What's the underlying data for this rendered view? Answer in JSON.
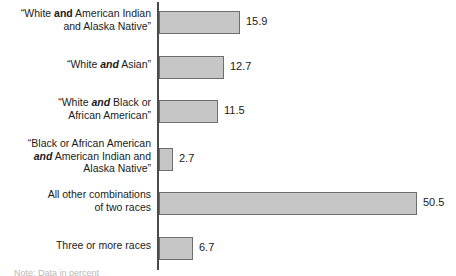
{
  "chart_data": {
    "type": "bar",
    "orientation": "horizontal",
    "title": "",
    "subtitle": "",
    "xlabel": "",
    "ylabel": "",
    "grid": false,
    "legend": null,
    "axis_range": [
      0,
      50.5
    ],
    "categories": [
      "“White and American Indian\nand Alaska Native”",
      "“White and Asian”",
      "“White and Black or\nAfrican American”",
      "“Black or African American\nand American Indian and\nAlaska Native”",
      "All other combinations\nof two races",
      "Three or more races"
    ],
    "values": [
      15.9,
      12.7,
      11.5,
      2.7,
      50.5,
      6.7
    ],
    "value_labels": [
      "15.9",
      "12.7",
      "11.5",
      "2.7",
      "50.5",
      "6.7"
    ]
  },
  "bars": [
    {
      "label_html": "“White <b>and</b> American Indian<br>and Alaska Native”",
      "value": 15.9,
      "value_label": "15.9",
      "top": 11,
      "label_top": 7,
      "lines": 2
    },
    {
      "label_html": "“White <i>and</i> Asian”",
      "value": 12.7,
      "value_label": "12.7",
      "top": 56,
      "label_top": 58,
      "lines": 1
    },
    {
      "label_html": "“White <i>and</i> Black or<br>African American”",
      "value": 11.5,
      "value_label": "11.5",
      "top": 100,
      "label_top": 96,
      "lines": 2
    },
    {
      "label_html": "“Black or African American<br><i>and</i> American Indian and<br>Alaska Native”",
      "value": 2.7,
      "value_label": "2.7",
      "top": 148,
      "label_top": 137,
      "lines": 3
    },
    {
      "label_html": "All other combinations<br>of two races",
      "value": 50.5,
      "value_label": "50.5",
      "top": 192,
      "label_top": 188,
      "lines": 2
    },
    {
      "label_html": "Three or more races",
      "value": 6.7,
      "value_label": "6.7",
      "top": 237,
      "label_top": 239,
      "lines": 1
    }
  ],
  "style": {
    "bar_fill": "#c6c6c6",
    "bar_border": "#6e6e6e",
    "axis_color": "#4a4a4a",
    "text_color": "#1a1a1a",
    "background": "#ffffff"
  },
  "geometry": {
    "axis_x": 159,
    "px_per_unit": 5.108,
    "bar_height": 23,
    "value_gap": 6
  },
  "caption": {
    "cut_off_text": "Note: Data in percent"
  }
}
